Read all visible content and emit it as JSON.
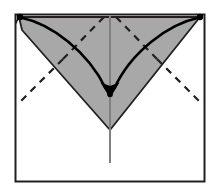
{
  "figure": {
    "title": "Origami fold step diagram",
    "caption": "",
    "type": "origami-fold-diagram"
  },
  "colors": {
    "background": "#ffffff",
    "paper_fill": "#ffffff",
    "shaded_fill": "#a8a8a8",
    "outline": "#231f20",
    "frame_border": "#231f20",
    "fold_line_dashed": "#231f20",
    "center_line": "#808080",
    "arrow_stroke": "#000000",
    "marker_dot": "#000000"
  },
  "canvas": {
    "width": 217,
    "height": 191
  },
  "frame": {
    "label": "paper-sheet-outline",
    "x": 15.5,
    "y": 14.5,
    "width": 189,
    "height": 167,
    "stroke_width": 2
  },
  "shaded_region": {
    "label": "folded-flap-triangle",
    "points": "19,17 22,30 110,130 200,17",
    "bevel_points": "15.5,22.5 22.5,15.5",
    "stroke_width": 1.8
  },
  "center_line": {
    "label": "vertical-center-crease",
    "x": 110,
    "y_top": 16,
    "y_bottom": 163,
    "stroke_width": 2
  },
  "arrows": [
    {
      "name": "arrow-left-corner-to-center",
      "path": "M 20.5 17.5 C 52 24 88 52 105.5 88",
      "stroke_width": 2.6,
      "head": "108,95 100.5,82.5 113,87"
    },
    {
      "name": "arrow-right-corner-to-center",
      "path": "M 199.5 17.5 C 168 24 131 52 114.5 88",
      "stroke_width": 2.6,
      "head": "112,95 107,87 119.5,82.5"
    }
  ],
  "dashed_folds": [
    {
      "name": "valley-fold-upper-left",
      "path": "M 104 17 L 63 59",
      "stroke_width": 2.2,
      "dash": "7 6"
    },
    {
      "name": "valley-fold-upper-right",
      "path": "M 116 17 L 157 59",
      "stroke_width": 2.2,
      "dash": "7 6"
    },
    {
      "name": "valley-fold-lower-left",
      "path": "M 63 59 L 17 105",
      "stroke_width": 2.2,
      "dash": "7 6"
    },
    {
      "name": "valley-fold-lower-right",
      "path": "M 157 59 L 203 105",
      "stroke_width": 2.2,
      "dash": "7 6"
    }
  ],
  "markers": [
    {
      "name": "corner-dot-top-left",
      "cx": 20,
      "cy": 17,
      "r": 3.2
    },
    {
      "name": "corner-dot-top-right",
      "cx": 200,
      "cy": 17,
      "r": 3.2
    },
    {
      "name": "target-dot-center",
      "cx": 110,
      "cy": 94.5,
      "r": 2.8
    }
  ]
}
